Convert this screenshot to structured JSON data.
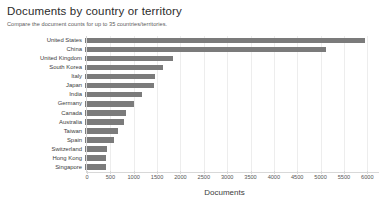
{
  "header": {
    "title": "Documents by country or territory",
    "subtitle": "Compare the document counts for up to 35 countries/territories."
  },
  "chart_data": {
    "type": "bar",
    "orientation": "horizontal",
    "title": "Documents by country or territory",
    "subtitle": "Compare the document counts for up to 35 countries/territories.",
    "xlabel": "Documents",
    "ylabel": "",
    "categories": [
      "United States",
      "China",
      "United Kingdom",
      "South Korea",
      "Italy",
      "Japan",
      "India",
      "Germany",
      "Canada",
      "Australia",
      "Taiwan",
      "Spain",
      "Switzerland",
      "Hong Kong",
      "Singapore"
    ],
    "values": [
      6000,
      5150,
      1880,
      1680,
      1490,
      1470,
      1230,
      1050,
      880,
      840,
      710,
      620,
      480,
      460,
      440
    ],
    "xlim": [
      0,
      6250
    ],
    "xticks": [
      0,
      500,
      1000,
      1500,
      2000,
      2500,
      3000,
      3500,
      4000,
      4500,
      5000,
      5500,
      6000
    ],
    "xticklabels": [
      "0",
      "500",
      "1000",
      "1500",
      "2000",
      "2500",
      "3000",
      "3500",
      "4000",
      "4500",
      "5000",
      "5500",
      "6000"
    ],
    "xtick_truncated_label": "6...",
    "grid": true,
    "grid_axis": "x",
    "legend": null,
    "bar_color": "#7b7b7b",
    "grid_color": "#ededed"
  }
}
